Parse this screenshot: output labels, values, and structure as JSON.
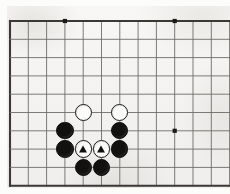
{
  "figure": {
    "kind": "go-board-diagram",
    "game": "Go",
    "alt_text": "Go diagram: two white stones marked with triangles are enclosed by black stones"
  },
  "board": {
    "background_color": "#f6f5f3",
    "line_color": "#6e6c69",
    "edge_color": "#3a3936",
    "star_point_color": "#1b1a18",
    "cell_size": 18.3,
    "origin_x": 10,
    "origin_y": 21,
    "columns": 12,
    "rows": 9,
    "edges_visible": [
      "left",
      "top",
      "bottom"
    ],
    "right_edge_cropped": true,
    "star_points": [
      {
        "name": "star-point-top-left",
        "col": 3,
        "row": 0
      },
      {
        "name": "star-point-top-right",
        "col": 9,
        "row": 0
      },
      {
        "name": "star-point-lower-right",
        "col": 9,
        "row": 6
      }
    ]
  },
  "stones": [
    {
      "id": "white-upper-left",
      "color": "white",
      "col": 4,
      "row": 5,
      "mark": "none"
    },
    {
      "id": "white-upper-right",
      "color": "white",
      "col": 6,
      "row": 5,
      "mark": "none"
    },
    {
      "id": "black-left-upper",
      "color": "black",
      "col": 3,
      "row": 6,
      "mark": "none"
    },
    {
      "id": "black-right-upper",
      "color": "black",
      "col": 6,
      "row": 6,
      "mark": "none"
    },
    {
      "id": "black-left-lower",
      "color": "black",
      "col": 3,
      "row": 7,
      "mark": "none"
    },
    {
      "id": "white-marked-left",
      "color": "white",
      "col": 4,
      "row": 7,
      "mark": "triangle"
    },
    {
      "id": "white-marked-right",
      "color": "white",
      "col": 5,
      "row": 7,
      "mark": "triangle"
    },
    {
      "id": "black-right-lower",
      "color": "black",
      "col": 6,
      "row": 7,
      "mark": "none"
    },
    {
      "id": "black-bottom-left",
      "color": "black",
      "col": 4,
      "row": 8,
      "mark": "none"
    },
    {
      "id": "black-bottom-right",
      "color": "black",
      "col": 5,
      "row": 8,
      "mark": "none"
    }
  ],
  "counts": {
    "black_stones": 6,
    "white_stones": 4,
    "marked_white_stones": 2
  },
  "stone_style": {
    "diameter": 17.4,
    "black_fill": "#121110",
    "white_fill": "#fbfbfa",
    "white_outline": "#171615",
    "triangle_mark_color": "#111010"
  }
}
